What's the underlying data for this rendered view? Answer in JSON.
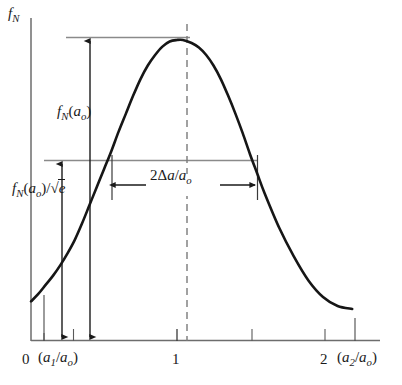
{
  "figure": {
    "title": "",
    "axes": {
      "y_axis_label": "fN",
      "x_axis_label": ""
    },
    "annotations": {
      "peak_amplitude_label": "fN(ao)",
      "half_amplitude_label": "fN(ao)/√e",
      "width_label": "2Δa/ao"
    },
    "x_tick_labels": {
      "zero": "0",
      "a1_ratio": "(a1/ao)",
      "one": "1",
      "two": "2",
      "a2_ratio": "(a2/ao)"
    },
    "colors": {
      "curve": "#161616",
      "axis": "#6b6b6b",
      "guide_line": "#888888",
      "dashed_line": "#7a7a7a",
      "text": "#1a1a1a",
      "background": "#ffffff"
    }
  },
  "chart_data": {
    "type": "line",
    "title": "",
    "xlabel": "",
    "ylabel": "fN",
    "xlim": [
      -0.22,
      2.55
    ],
    "ylim": [
      0,
      1.12
    ],
    "grid": false,
    "legend": null,
    "annotations": [
      {
        "name": "peak-amplitude-arrow",
        "text": "fN(ao)",
        "orientation": "vertical",
        "x": 0.4,
        "y_from": 0.0,
        "y_to": 1.0
      },
      {
        "name": "half-amplitude-arrow",
        "text": "fN(ao)/√e",
        "orientation": "vertical",
        "x": 0.21,
        "y_from": 0.0,
        "y_to": 0.607
      },
      {
        "name": "width-arrow",
        "text": "2Δa/ao",
        "orientation": "horizontal",
        "y": 0.607,
        "x_from": 0.55,
        "x_to": 1.52
      },
      {
        "name": "peak-level-guide",
        "text": "",
        "orientation": "horizontal",
        "y": 1.0,
        "x_from": 0.245,
        "x_to": 1.07
      },
      {
        "name": "half-level-guide",
        "text": "",
        "orientation": "horizontal",
        "y": 0.607,
        "x_from": 0.09,
        "x_to": 1.52
      },
      {
        "name": "peak-center-dashed",
        "text": "",
        "orientation": "vertical",
        "x": 1.04,
        "y_from": 0.0,
        "y_to": 1.1
      }
    ],
    "x_ticks": [
      {
        "value": 0.0,
        "label": "0"
      },
      {
        "value": 0.1,
        "label": ""
      },
      {
        "value": 0.21,
        "label": "(a1/ao)"
      },
      {
        "value": 0.34,
        "label": ""
      },
      {
        "value": 1.0,
        "label": "1"
      },
      {
        "value": 1.5,
        "label": ""
      },
      {
        "value": 2.0,
        "label": "2"
      },
      {
        "value": 2.2,
        "label": "(a2/ao)"
      }
    ],
    "series": [
      {
        "name": "fN",
        "description": "Log-normal-like distribution of normalized flaw size",
        "x": [
          0.0,
          0.05,
          0.1,
          0.15,
          0.2,
          0.25,
          0.3,
          0.35,
          0.4,
          0.45,
          0.5,
          0.55,
          0.6,
          0.65,
          0.7,
          0.75,
          0.8,
          0.85,
          0.9,
          0.95,
          1.0,
          1.04,
          1.1,
          1.15,
          1.2,
          1.25,
          1.3,
          1.35,
          1.4,
          1.45,
          1.5,
          1.55,
          1.6,
          1.7,
          1.8,
          1.9,
          2.0,
          2.1,
          2.2
        ],
        "y": [
          0.13,
          0.155,
          0.185,
          0.215,
          0.25,
          0.29,
          0.335,
          0.39,
          0.45,
          0.51,
          0.57,
          0.63,
          0.695,
          0.755,
          0.815,
          0.87,
          0.915,
          0.95,
          0.978,
          0.995,
          1.0,
          1.0,
          0.99,
          0.975,
          0.95,
          0.915,
          0.87,
          0.815,
          0.755,
          0.69,
          0.62,
          0.555,
          0.49,
          0.375,
          0.28,
          0.2,
          0.145,
          0.115,
          0.105
        ]
      }
    ]
  }
}
